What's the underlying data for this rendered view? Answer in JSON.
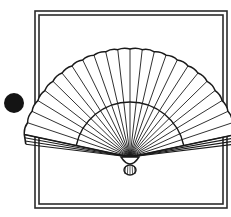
{
  "image": {
    "title": "Folding Fan Illustration",
    "width": 231,
    "height": 217,
    "background_color": "#ffffff",
    "ink_color": "#1a1a1a"
  },
  "bullet_marker": {
    "name": "filled circle bullet",
    "shape": "circle",
    "center_x": 14,
    "center_y": 103,
    "radius": 10,
    "fill_color": "#141414"
  },
  "frame": {
    "name": "double line square border",
    "outer": {
      "x": 35,
      "y": 11,
      "width": 192,
      "height": 197
    },
    "inner": {
      "x": 39,
      "y": 15,
      "width": 184,
      "height": 189
    },
    "stroke_color": "#2b2b2b",
    "outer_stroke_width": 1.6,
    "inner_stroke_width": 1.6,
    "fill_color": "#ffffff"
  },
  "fan": {
    "name": "open folding hand fan",
    "pivot_x": 130,
    "pivot_y": 157,
    "outer_radius": 108,
    "inner_radius": 55,
    "start_angle_deg": 192,
    "end_angle_deg": 348,
    "rib_count": 25,
    "stroke_color": "#1a1a1a",
    "rib_stroke_width": 0.9,
    "leaf_stroke_width": 1.5,
    "guard_stroke_width": 1.6,
    "guard_offset_deg": 5,
    "fill_color": "#ffffff",
    "rivet": {
      "name": "pivot rivet knob",
      "center_x": 130,
      "center_y": 163,
      "radius_x": 9,
      "radius_y": 7,
      "fill_color": "#ffffff",
      "stroke_color": "#1a1a1a"
    },
    "tassel": {
      "name": "tassel knob below pivot",
      "center_x": 130,
      "center_y": 170,
      "radius_x": 6,
      "radius_y": 5
    }
  }
}
